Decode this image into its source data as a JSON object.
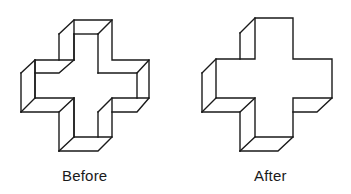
{
  "figure": {
    "panels": [
      {
        "id": "before",
        "label": "Before",
        "interpretation": "hollow / recessed cross"
      },
      {
        "id": "after",
        "label": "After",
        "interpretation": "solid / protruding cross"
      }
    ],
    "colors": {
      "line": "#1a1a1a",
      "background": "#ffffff"
    }
  }
}
